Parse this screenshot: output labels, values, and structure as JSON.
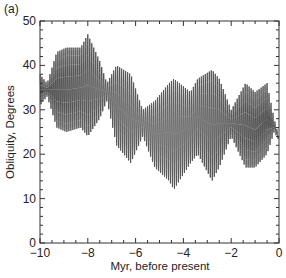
{
  "panel_label": "(a)",
  "chart_data": {
    "type": "line",
    "title": "",
    "xlabel": "Myr, before present",
    "ylabel": "Obliquity, Degrees",
    "xlim": [
      -10,
      0
    ],
    "ylim": [
      0,
      50
    ],
    "xticks": [
      -10,
      -8,
      -6,
      -4,
      -2,
      0
    ],
    "xtick_labels": [
      "−10",
      "−8",
      "−6",
      "−4",
      "−2",
      "0"
    ],
    "yticks": [
      0,
      10,
      20,
      30,
      40,
      50
    ],
    "ytick_labels": [
      "0",
      "10",
      "20",
      "30",
      "40",
      "50"
    ],
    "grid": false,
    "legend": null,
    "line_color": "#555555",
    "oscillation_cycles": 120,
    "series": [
      {
        "name": "Obliquity envelope",
        "x": [
          -10,
          -9.7,
          -9.3,
          -8.9,
          -8.3,
          -8.0,
          -7.5,
          -7.2,
          -6.8,
          -6.2,
          -5.7,
          -5.2,
          -4.6,
          -4.4,
          -3.7,
          -3.4,
          -2.8,
          -2.5,
          -2.0,
          -1.4,
          -1.0,
          -0.5,
          -0.2,
          0
        ],
        "max": [
          38,
          36,
          43,
          44,
          44,
          47,
          41,
          36,
          40,
          38,
          30,
          32,
          36,
          37,
          34,
          37,
          39,
          37,
          30,
          36,
          34,
          36,
          28,
          24
        ],
        "min": [
          31,
          33,
          26,
          25,
          26,
          24,
          28,
          32,
          22,
          18,
          24,
          17,
          14,
          12,
          18,
          20,
          14,
          17,
          24,
          17,
          17,
          20,
          25,
          23
        ]
      }
    ]
  }
}
